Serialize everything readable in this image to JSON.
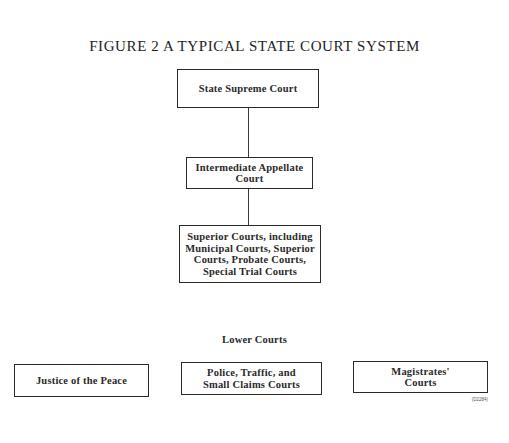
{
  "figure": {
    "title": "FIGURE 2   A TYPICAL STATE COURT SYSTEM",
    "id_label": "(D2284)"
  },
  "hierarchy": {
    "supreme": "State Supreme Court",
    "appellate": "Intermediate Appellate\nCourt",
    "superior": "Superior Courts, including\nMunicipal Courts, Superior\nCourts, Probate Courts,\nSpecial Trial Courts"
  },
  "lower_courts": {
    "label": "Lower Courts",
    "items": [
      "Justice of the Peace",
      "Police, Traffic, and\nSmall Claims Courts",
      "Magistrates'\nCourts"
    ]
  },
  "colors": {
    "line": "#2a2a2a",
    "text": "#2a2a2a",
    "background": "#ffffff"
  }
}
